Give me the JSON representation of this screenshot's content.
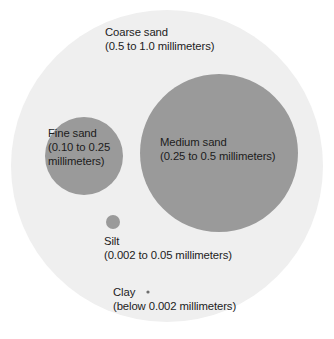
{
  "figure": {
    "background_color": "#ffffff",
    "outer_circle_color": "#efefef",
    "particle_color": "#9a9a9a",
    "text_color": "#1c1c1c"
  },
  "chart_data": {
    "type": "scatter",
    "xlabel": "",
    "ylabel": "",
    "units": "millimeters",
    "categories": [
      "Coarse sand",
      "Medium sand",
      "Fine sand",
      "Silt",
      "Clay"
    ],
    "series": [
      {
        "name": "Particle diameter range (mm)",
        "values": [
          {
            "label": "Coarse sand",
            "min": 0.5,
            "max": 1.0,
            "radius_px": 156
          },
          {
            "label": "Medium sand",
            "min": 0.25,
            "max": 0.5,
            "radius_px": 79
          },
          {
            "label": "Fine sand",
            "min": 0.1,
            "max": 0.25,
            "radius_px": 39
          },
          {
            "label": "Silt",
            "min": 0.002,
            "max": 0.05,
            "radius_px": 7
          },
          {
            "label": "Clay",
            "min": 0,
            "max": 0.002,
            "radius_px": 1.6
          }
        ]
      }
    ]
  },
  "particles": {
    "coarse_sand": {
      "name": "Coarse sand",
      "range": "(0.5 to 1.0 millimeters)",
      "cx": 167,
      "cy": 166,
      "r": 156,
      "fill": "#efefef"
    },
    "medium_sand": {
      "name": "Medium sand",
      "range": "(0.25 to 0.5 millimeters)",
      "cx": 219,
      "cy": 153,
      "r": 79,
      "fill": "#9a9a9a"
    },
    "fine_sand": {
      "name": "Fine sand",
      "range_line1": "(0.10 to 0.25",
      "range_line2": "millimeters)",
      "cx": 84,
      "cy": 156,
      "r": 39,
      "fill": "#9a9a9a"
    },
    "silt": {
      "name": "Silt",
      "range": "(0.002 to 0.05 millimeters)",
      "cx": 113,
      "cy": 222,
      "r": 7,
      "fill": "#9a9a9a"
    },
    "clay": {
      "name": "Clay",
      "range": "(below 0.002 millimeters)",
      "cx": 148,
      "cy": 292,
      "r": 1.6,
      "fill": "#6d6d6d"
    }
  }
}
